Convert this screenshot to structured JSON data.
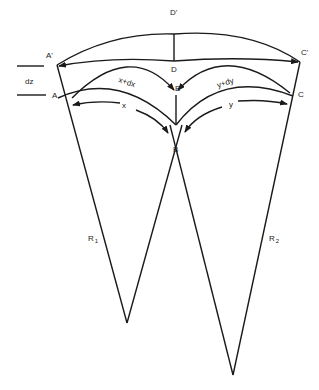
{
  "diagram": {
    "labels": {
      "A_prime": "A'",
      "A": "A",
      "B_prime": "B'",
      "B": "B",
      "C_prime": "C'",
      "C": "C",
      "D_prime": "D'",
      "D": "D",
      "dz": "dz",
      "x": "x",
      "x_dx": "x+dx",
      "y": "y",
      "y_dy": "y+dy",
      "R1_main": "R",
      "R1_sub": "1",
      "R2_main": "R",
      "R2_sub": "2"
    },
    "colors": {
      "line": "#1a1a1a",
      "background": "#ffffff"
    }
  }
}
